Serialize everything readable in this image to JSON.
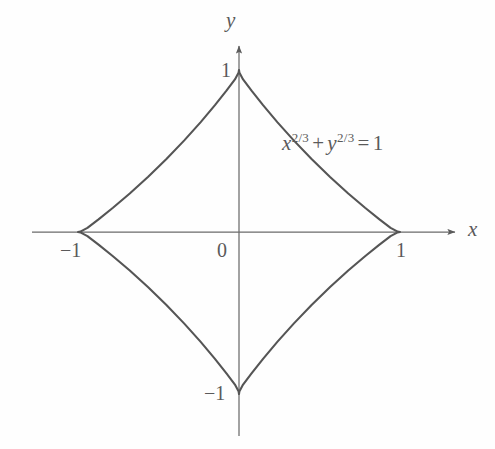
{
  "figure": {
    "background_color": "#fefefe",
    "curve_color": "#555555",
    "axis_color": "#666666",
    "text_color": "#5a5a5a"
  },
  "axes": {
    "x_label": "x",
    "y_label": "y",
    "origin_label": "0",
    "x_ticks": [
      {
        "value": -1,
        "label": "−1"
      },
      {
        "value": 1,
        "label": "1"
      }
    ],
    "y_ticks": [
      {
        "value": 1,
        "label": "1"
      },
      {
        "value": -1,
        "label": "−1"
      }
    ]
  },
  "equation": {
    "full_text": "x^{2/3} + y^{2/3} = 1",
    "base_x": "x",
    "exp_x": "2/3",
    "plus": "+",
    "base_y": "y",
    "exp_y": "2/3",
    "equals": "=",
    "rhs": "1"
  },
  "chart_data": {
    "type": "line",
    "title": "",
    "subtitle": "",
    "xlabel": "x",
    "ylabel": "y",
    "xlim": [
      -1.33,
      1.36
    ],
    "ylim": [
      -1.25,
      1.18
    ],
    "grid": false,
    "legend": null,
    "annotations": [
      {
        "text": "x^{2/3} + y^{2/3} = 1",
        "x": 0.66,
        "y": 0.53
      }
    ],
    "xticks": [
      -1,
      0,
      1
    ],
    "xticklabels": [
      "−1",
      "0",
      "1"
    ],
    "yticks": [
      -1,
      1
    ],
    "yticklabels": [
      "−1",
      "1"
    ],
    "series": [
      {
        "name": "astroid",
        "equation": "x^(2/3) + y^(2/3) = 1",
        "parametric": "x = cos^3(t), y = sin^3(t), t in [0, 2*pi)",
        "closed": true,
        "cusps": [
          {
            "x": 1,
            "y": 0
          },
          {
            "x": 0,
            "y": 1
          },
          {
            "x": -1,
            "y": 0
          },
          {
            "x": 0,
            "y": -1
          }
        ],
        "x": [
          1.0,
          0.9851,
          0.9415,
          0.8725,
          0.7829,
          0.6785,
          0.5657,
          0.4508,
          0.3398,
          0.2379,
          0.1494,
          0.0779,
          0.0253,
          0.0022,
          0.0,
          -0.0022,
          -0.0253,
          -0.0779,
          -0.1494,
          -0.2379,
          -0.3398,
          -0.4508,
          -0.5657,
          -0.6785,
          -0.7829,
          -0.8725,
          -0.9415,
          -0.9851,
          -1.0,
          -0.9851,
          -0.9415,
          -0.8725,
          -0.7829,
          -0.6785,
          -0.5657,
          -0.4508,
          -0.3398,
          -0.2379,
          -0.1494,
          -0.0779,
          -0.0253,
          -0.0022,
          0.0,
          0.0022,
          0.0253,
          0.0779,
          0.1494,
          0.2379,
          0.3398,
          0.4508,
          0.5657,
          0.6785,
          0.7829,
          0.8725,
          0.9415,
          0.9851,
          1.0
        ],
        "y": [
          0.0,
          0.0022,
          0.0253,
          0.0779,
          0.1494,
          0.2379,
          0.3398,
          0.4508,
          0.5657,
          0.6785,
          0.7829,
          0.8725,
          0.9415,
          0.9851,
          1.0,
          0.9851,
          0.9415,
          0.8725,
          0.7829,
          0.6785,
          0.5657,
          0.4508,
          0.3398,
          0.2379,
          0.1494,
          0.0779,
          0.0253,
          0.0022,
          0.0,
          -0.0022,
          -0.0253,
          -0.0779,
          -0.1494,
          -0.2379,
          -0.3398,
          -0.4508,
          -0.5657,
          -0.6785,
          -0.7829,
          -0.8725,
          -0.9415,
          -0.9851,
          -1.0,
          -0.9851,
          -0.9415,
          -0.8725,
          -0.7829,
          -0.6785,
          -0.5657,
          -0.4508,
          -0.3398,
          -0.2379,
          -0.1494,
          -0.0779,
          -0.0253,
          -0.0022,
          0.0
        ]
      }
    ]
  }
}
